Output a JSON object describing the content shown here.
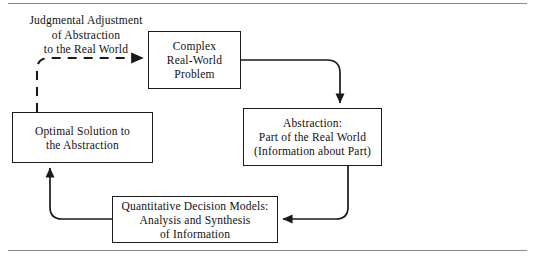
{
  "figure": {
    "line_color": "#1a1a1a",
    "rule_color": "#8a8a8a",
    "background": "#ffffff"
  },
  "caption": {
    "name": "judgmental-adjustment-label",
    "lines": [
      "Judgmental Adjustment",
      "of Abstraction",
      "to the Real World"
    ]
  },
  "nodes": [
    {
      "id": "complex-real-world-problem",
      "lines": [
        "Complex",
        "Real-World",
        "Problem"
      ]
    },
    {
      "id": "abstraction",
      "lines": [
        "Abstraction:",
        "Part of the Real World",
        "(Information about Part)"
      ]
    },
    {
      "id": "optimal-solution",
      "lines": [
        "Optimal Solution to",
        "the Abstraction"
      ]
    },
    {
      "id": "quantitative-decision-models",
      "lines": [
        "Quantitative Decision Models:",
        "Analysis and Synthesis",
        "of Information"
      ]
    }
  ],
  "connectors": [
    {
      "id": "optimal-to-complex",
      "style": "dashed",
      "from": "optimal-solution",
      "to": "complex-real-world-problem"
    },
    {
      "id": "complex-to-abstraction",
      "style": "solid",
      "from": "complex-real-world-problem",
      "to": "abstraction"
    },
    {
      "id": "abstraction-to-quantitative",
      "style": "solid",
      "from": "abstraction",
      "to": "quantitative-decision-models"
    },
    {
      "id": "quantitative-to-optimal",
      "style": "solid",
      "from": "quantitative-decision-models",
      "to": "optimal-solution"
    }
  ]
}
